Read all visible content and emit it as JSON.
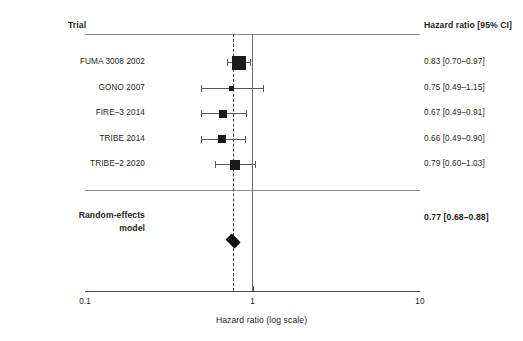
{
  "chart_data": {
    "type": "forest",
    "title": "",
    "xlabel": "Hazard ratio (log scale)",
    "ylabel": "",
    "scale": "log",
    "xlim": [
      0.1,
      10
    ],
    "xticks": [
      0.1,
      1,
      10
    ],
    "xtick_labels": [
      "0.1",
      "1",
      "10"
    ],
    "grid": false,
    "null_value": 1,
    "pooled_reference_line": 0.77,
    "columns": {
      "trial_header": "Trial",
      "effect_header": "Hazard ratio [95% CI]"
    },
    "studies": [
      {
        "label": "FUMA 3008 2002",
        "estimate": 0.83,
        "ci_low": 0.7,
        "ci_high": 0.97,
        "ci_text": "0.83 [0.70–0.97]",
        "marker_size": 14
      },
      {
        "label": "GONO 2007",
        "estimate": 0.75,
        "ci_low": 0.49,
        "ci_high": 1.15,
        "ci_text": "0.75 [0.49–1.15]",
        "marker_size": 5
      },
      {
        "label": "FIRE–3 2014",
        "estimate": 0.67,
        "ci_low": 0.49,
        "ci_high": 0.91,
        "ci_text": "0.67 [0.49–0.91]",
        "marker_size": 8
      },
      {
        "label": "TRIBE 2014",
        "estimate": 0.66,
        "ci_low": 0.49,
        "ci_high": 0.9,
        "ci_text": "0.66 [0.49–0.90]",
        "marker_size": 8
      },
      {
        "label": "TRIBE–2 2020",
        "estimate": 0.79,
        "ci_low": 0.6,
        "ci_high": 1.03,
        "ci_text": "0.79 [0.60–1.03]",
        "marker_size": 10
      }
    ],
    "summary": {
      "label_line1": "Random-effects",
      "label_line2": "model",
      "estimate": 0.77,
      "ci_low": 0.68,
      "ci_high": 0.88,
      "ci_text": "0.77 [0.68–0.88]"
    },
    "colors": {
      "marker": "#1a1a1a",
      "diamond": "#111111",
      "whisker": "#55595c",
      "null_line": "#6a6a6a",
      "pooled_line": "#3a3a3a",
      "rule": "#8d8d8d",
      "axis": "#4a4a4a",
      "text": "#231f20",
      "background": "#ffffff"
    }
  },
  "layout": {
    "plot_left_px": 85,
    "plot_right_px": 420,
    "header_y_px": 21,
    "header_rule_y_px": 34,
    "first_row_y_px": 62,
    "row_step_px": 25.6,
    "separator_rule_y_px": 190,
    "summary_label_y_px": 214,
    "summary_marker_y_px": 241,
    "axis_y_px": 291,
    "tick_label_y_px": 298,
    "axis_title_y_px": 316,
    "trial_label_right_px": 145,
    "ci_label_left_px": 424,
    "ref_line_top_px": 34,
    "ref_line_bottom_px": 291
  }
}
